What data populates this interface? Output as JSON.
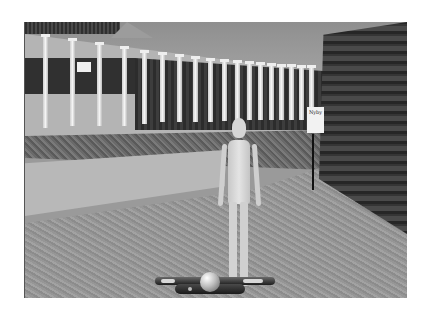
{
  "scene": {
    "description": "3D virtual environment with classical colonnade, hedge, low wall, stone-textured ground, brick wall and an avatar",
    "sign": {
      "text": "Nyby"
    },
    "avatar": {
      "label": "avatar"
    },
    "navigation": {
      "controls": [
        "move-left",
        "look",
        "move-right"
      ]
    },
    "colors": {
      "background": "#ffffff",
      "sky": "#9a9a9a",
      "ground": "#969696",
      "brick_wall": "#353535",
      "avatar": "#d4d4d4"
    }
  }
}
